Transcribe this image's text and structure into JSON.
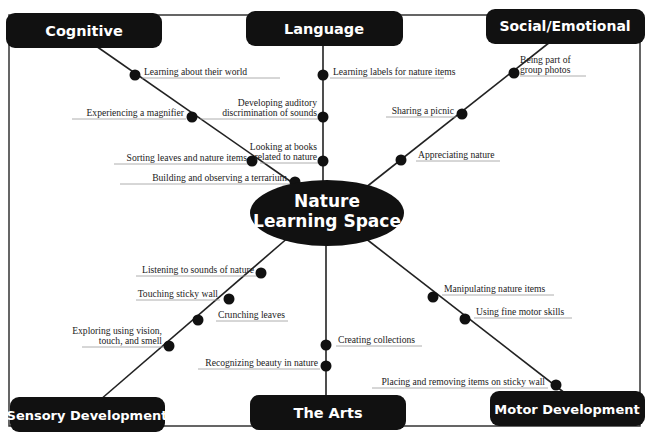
{
  "title_partial": "",
  "colors": {
    "node_fill": "#111111",
    "node_text": "#ffffff",
    "line": "#222222",
    "leaf_text": "#222222",
    "underline": "#999999",
    "border": "#333333"
  },
  "center": {
    "line1": "Nature",
    "line2": "Learning Space"
  },
  "categories": {
    "cognitive": {
      "label": "Cognitive",
      "items": [
        "Learning about their world",
        "Experiencing a magnifier",
        "Sorting leaves and nature items",
        "Building and observing a terrarium"
      ]
    },
    "language": {
      "label": "Language",
      "items": [
        "Learning labels for nature items",
        [
          "Developing auditory",
          "discrimination of sounds"
        ],
        [
          "Looking at books",
          "related to nature"
        ]
      ]
    },
    "social": {
      "label": "Social/Emotional",
      "items": [
        [
          "Being part of",
          "group photos"
        ],
        "Sharing a picnic",
        "Appreciating nature"
      ]
    },
    "sensory": {
      "label": "Sensory Development",
      "items": [
        "Listening to sounds of nature",
        "Touching sticky wall",
        "Crunching leaves",
        [
          "Exploring using vision,",
          "touch, and smell"
        ]
      ]
    },
    "arts": {
      "label": "The Arts",
      "items": [
        "Creating collections",
        "Recognizing beauty in nature"
      ]
    },
    "motor": {
      "label": "Motor Development",
      "items": [
        "Manipulating nature items",
        "Using fine motor skills",
        "Placing and removing items on sticky wall"
      ]
    }
  }
}
